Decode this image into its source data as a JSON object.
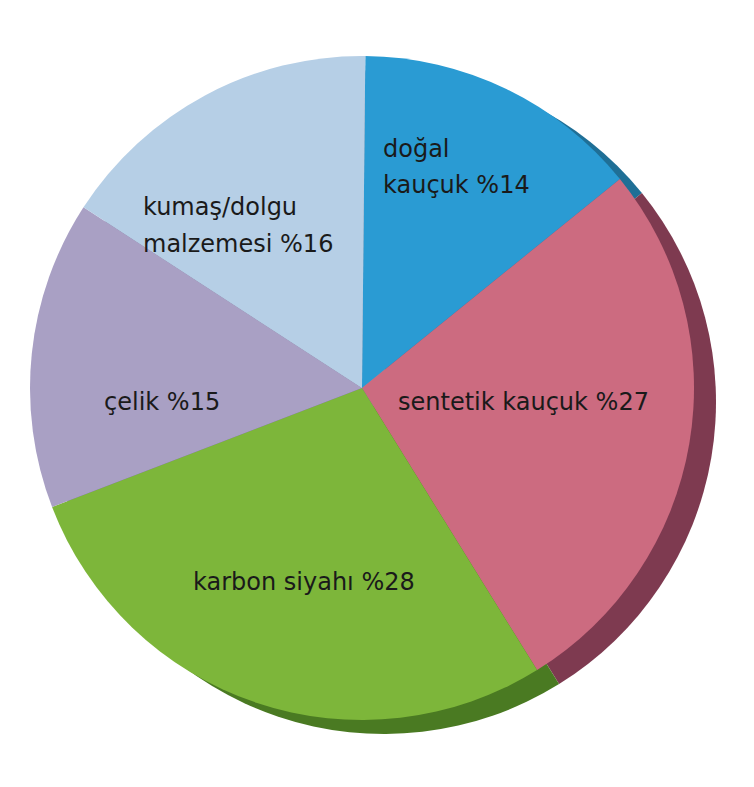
{
  "chart_data": {
    "type": "pie",
    "title": "",
    "style": "3d-offset-shadow",
    "slices": [
      {
        "label": "doğal kauçuk",
        "value": 14,
        "display": [
          "doğal",
          "kauçuk %14"
        ],
        "color": "#2a9bd3",
        "shadow": "#1f6f96"
      },
      {
        "label": "sentetik kauçuk",
        "value": 27,
        "display": [
          "sentetik kauçuk %27"
        ],
        "color": "#cc6b80",
        "shadow": "#7e3a50"
      },
      {
        "label": "karbon siyahı",
        "value": 28,
        "display": [
          "karbon siyahı %28"
        ],
        "color": "#7db63a",
        "shadow": "#4a7a22"
      },
      {
        "label": "çelik",
        "value": 15,
        "display": [
          "çelik %15"
        ],
        "color": "#a9a0c4",
        "shadow": "#6e6890"
      },
      {
        "label": "kumaş/dolgu malzemesi",
        "value": 16,
        "display": [
          "kumaş/dolgu",
          "malzemesi %16"
        ],
        "color": "#b6cfe6",
        "shadow": "#7f95ab"
      }
    ],
    "unit": "%",
    "legend": "none (labels inside slices)"
  }
}
